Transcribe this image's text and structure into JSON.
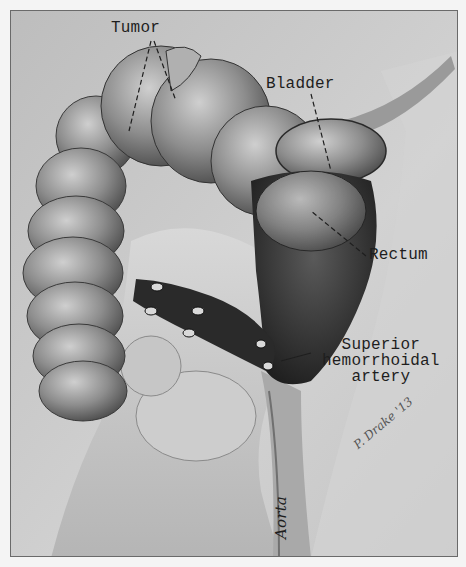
{
  "figure": {
    "type": "medical-illustration",
    "style": "grayscale pencil drawing",
    "labels": {
      "tumor": "Tumor",
      "bladder": "Bladder",
      "rectum": "Rectum",
      "artery_line1": "Superior",
      "artery_line2": "hemorrhoidal",
      "artery_line3": "artery",
      "aorta": "Aorta"
    },
    "signature": "P. Drake '13"
  },
  "colors": {
    "background": "#c9c9c9",
    "frame": "#6a6a6a",
    "ink": "#1e1e1e",
    "shadow": "#2a2a2a"
  }
}
